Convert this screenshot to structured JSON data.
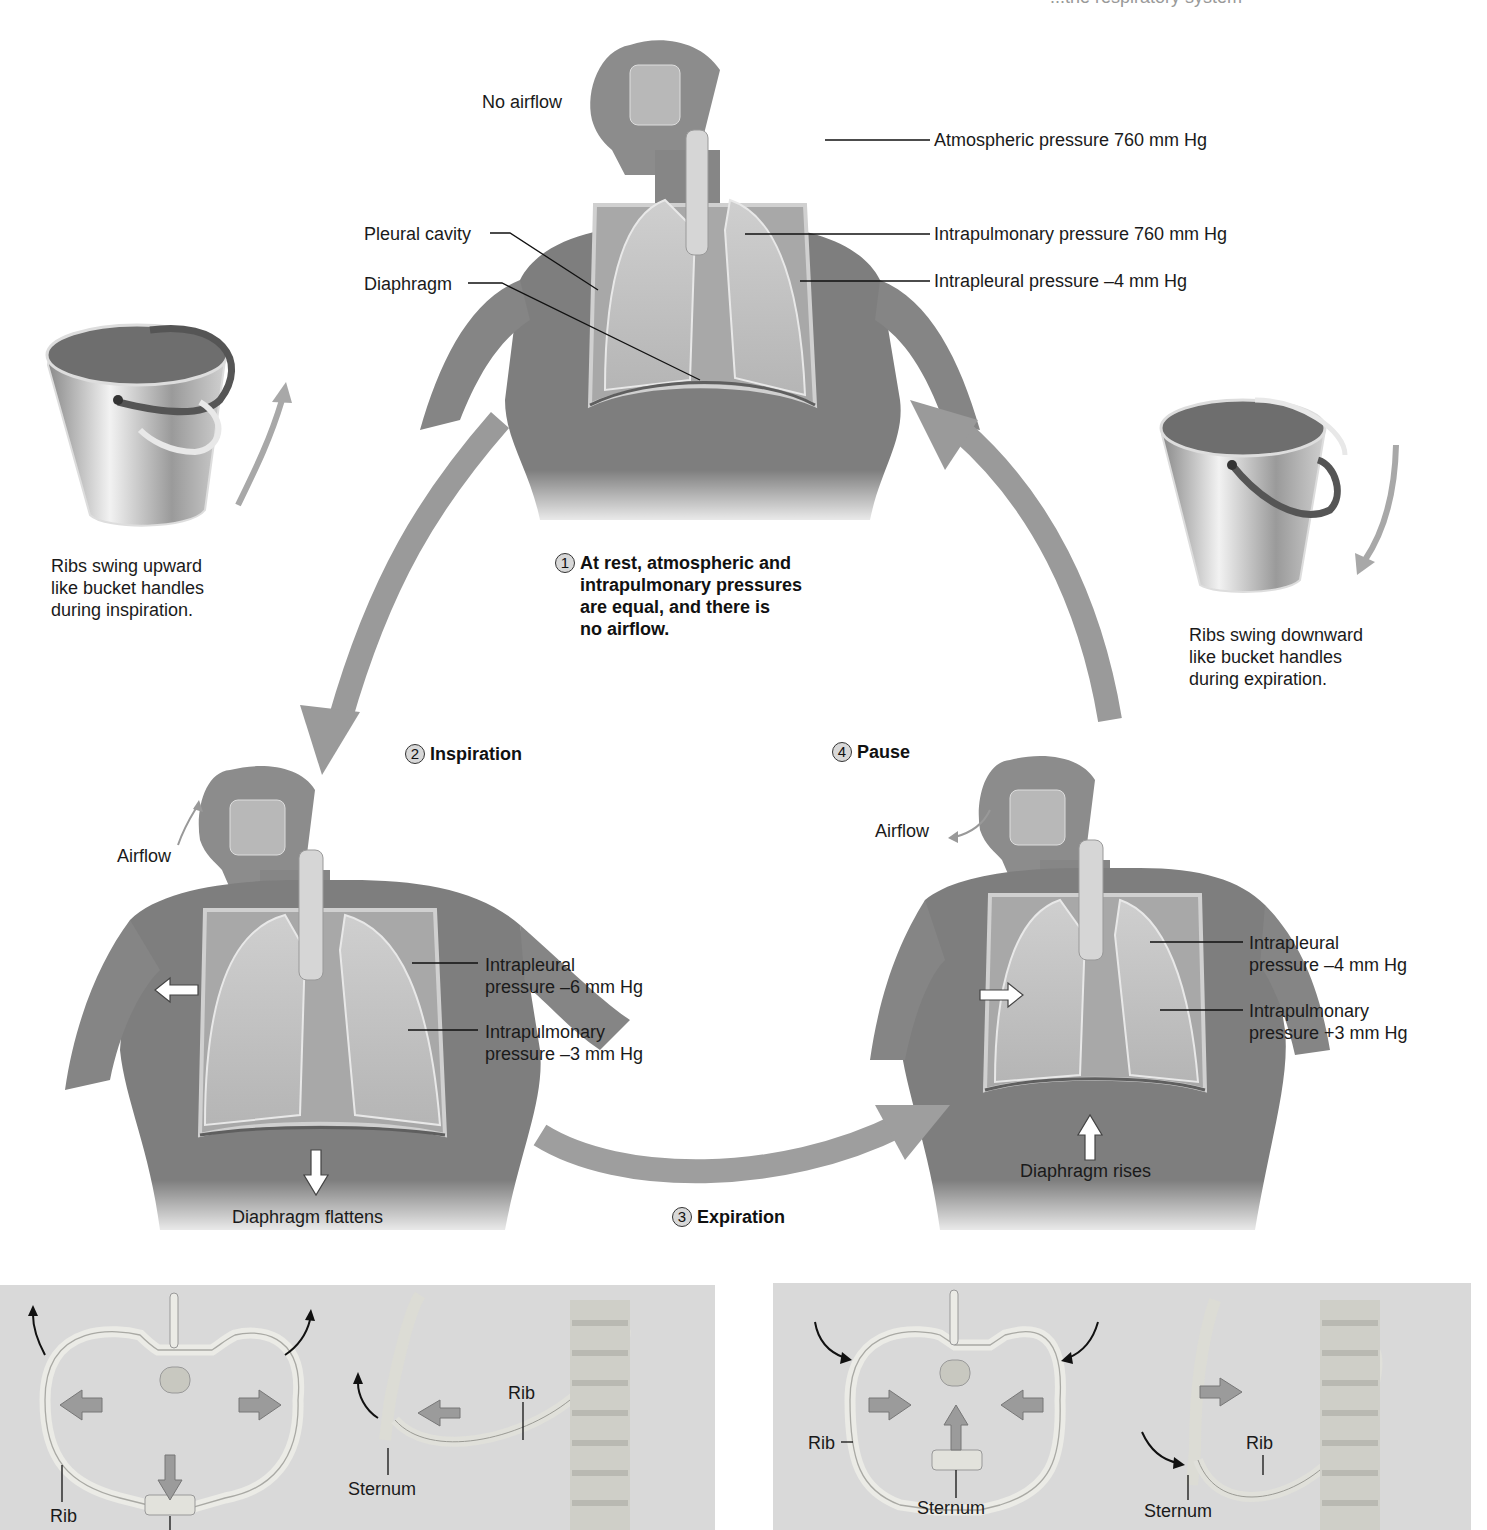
{
  "header": {
    "partial_title": "...the respiratory system"
  },
  "top_figure": {
    "state": "rest",
    "airflow_label": "No airflow",
    "labels": {
      "atmospheric": "Atmospheric pressure 760 mm Hg",
      "intrapulmonary": "Intrapulmonary pressure 760 mm Hg",
      "intrapleural": "Intrapleural pressure –4 mm Hg",
      "pleural_cavity": "Pleural cavity",
      "diaphragm": "Diaphragm"
    }
  },
  "steps": [
    {
      "number": "1",
      "text_lines": [
        "At rest, atmospheric and",
        "intrapulmonary pressures",
        "are equal, and there is",
        "no airflow."
      ]
    },
    {
      "number": "2",
      "text": "Inspiration"
    },
    {
      "number": "3",
      "text": "Expiration"
    },
    {
      "number": "4",
      "text": "Pause"
    }
  ],
  "left_bucket": {
    "caption_lines": [
      "Ribs swing upward",
      "like bucket handles",
      "during inspiration."
    ]
  },
  "right_bucket": {
    "caption_lines": [
      "Ribs swing downward",
      "like bucket handles",
      "during expiration."
    ]
  },
  "left_figure": {
    "airflow_label": "Airflow",
    "intrapleural_lines": [
      "Intrapleural",
      "pressure –6 mm Hg"
    ],
    "intrapulmonary_lines": [
      "Intrapulmonary",
      "pressure –3 mm Hg"
    ],
    "diaphragm_label": "Diaphragm flattens"
  },
  "right_figure": {
    "airflow_label": "Airflow",
    "intrapleural_lines": [
      "Intrapleural",
      "pressure –4 mm Hg"
    ],
    "intrapulmonary_lines": [
      "Intrapulmonary",
      "pressure +3 mm Hg"
    ],
    "diaphragm_label": "Diaphragm rises"
  },
  "bottom_left_panel": {
    "rib_label_1": "Rib",
    "rib_label_2": "Rib",
    "sternum_label": "Sternum"
  },
  "bottom_right_panel": {
    "rib_label_1": "Rib",
    "rib_label_2": "Rib",
    "sternum_label_1": "Sternum",
    "sternum_label_2": "Sternum"
  },
  "colors": {
    "arrow_gray": "#9a9a9a",
    "panel_bg": "#d9d9d9",
    "body_gray": "#7c7c7c",
    "bone": "#e4e4e0"
  }
}
